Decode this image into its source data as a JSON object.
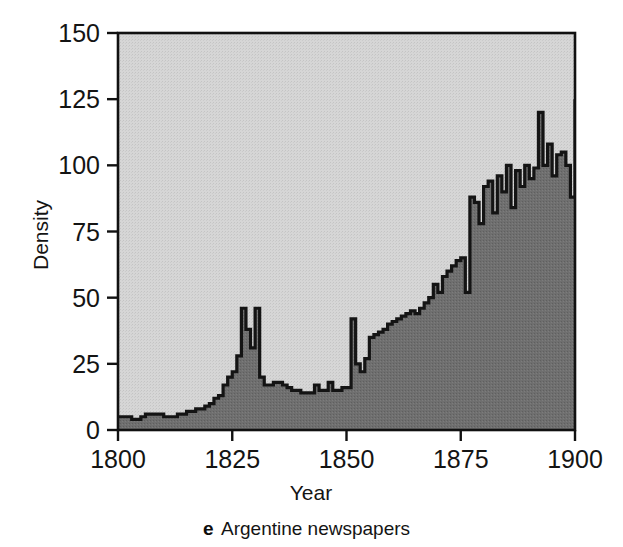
{
  "figure": {
    "caption_letter": "e",
    "caption_text": "Argentine newspapers",
    "background_color": "#ffffff"
  },
  "axes": {
    "x_title": "Year",
    "y_title": "Density",
    "x_ticks": [
      "1800",
      "1825",
      "1850",
      "1875",
      "1900"
    ],
    "y_ticks": [
      "0",
      "25",
      "50",
      "75",
      "100",
      "125",
      "150"
    ]
  },
  "colors": {
    "plot_upper_fill": "#d2d2d2",
    "area_fill": "#6e6e6e",
    "line": "#141414",
    "axis": "#111111"
  },
  "chart_data": {
    "type": "area",
    "title": "Argentine newspapers",
    "subtitle": "",
    "xlabel": "Year",
    "ylabel": "Density",
    "xlim": [
      1800,
      1900
    ],
    "ylim": [
      0,
      150
    ],
    "xticks": [
      1800,
      1825,
      1850,
      1875,
      1900
    ],
    "yticks": [
      0,
      25,
      50,
      75,
      100,
      125,
      150
    ],
    "grid": false,
    "legend": "none",
    "step_style": "post",
    "series": [
      {
        "name": "Argentine newspapers",
        "x": [
          1800,
          1801,
          1802,
          1803,
          1804,
          1805,
          1806,
          1807,
          1808,
          1809,
          1810,
          1811,
          1812,
          1813,
          1814,
          1815,
          1816,
          1817,
          1818,
          1819,
          1820,
          1821,
          1822,
          1823,
          1824,
          1825,
          1826,
          1827,
          1828,
          1829,
          1830,
          1831,
          1832,
          1833,
          1834,
          1835,
          1836,
          1837,
          1838,
          1839,
          1840,
          1841,
          1842,
          1843,
          1844,
          1845,
          1846,
          1847,
          1848,
          1849,
          1850,
          1851,
          1852,
          1853,
          1854,
          1855,
          1856,
          1857,
          1858,
          1859,
          1860,
          1861,
          1862,
          1863,
          1864,
          1865,
          1866,
          1867,
          1868,
          1869,
          1870,
          1871,
          1872,
          1873,
          1874,
          1875,
          1876,
          1877,
          1878,
          1879,
          1880,
          1881,
          1882,
          1883,
          1884,
          1885,
          1886,
          1887,
          1888,
          1889,
          1890,
          1891,
          1892,
          1893,
          1894,
          1895,
          1896,
          1897,
          1898,
          1899,
          1900
        ],
        "values": [
          5,
          5,
          5,
          4,
          4,
          5,
          6,
          6,
          6,
          6,
          5,
          5,
          5,
          6,
          6,
          7,
          7,
          8,
          8,
          9,
          10,
          12,
          13,
          17,
          20,
          22,
          28,
          46,
          38,
          31,
          46,
          20,
          17,
          17,
          18,
          18,
          17,
          16,
          15,
          15,
          14,
          14,
          14,
          17,
          15,
          15,
          18,
          15,
          15,
          16,
          16,
          42,
          25,
          22,
          27,
          35,
          36,
          37,
          38,
          40,
          41,
          42,
          43,
          44,
          45,
          44,
          46,
          48,
          50,
          55,
          52,
          58,
          60,
          62,
          64,
          65,
          52,
          88,
          86,
          78,
          92,
          94,
          82,
          96,
          90,
          100,
          84,
          98,
          92,
          100,
          95,
          99,
          120,
          100,
          108,
          96,
          104,
          105,
          100,
          88,
          125
        ]
      }
    ]
  }
}
